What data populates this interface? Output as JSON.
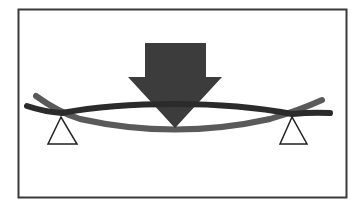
{
  "diagram": {
    "colors": {
      "background": "#ffffff",
      "frame": "#3a3a3a",
      "arrow": "#3c3c3c",
      "beam_straight": "#2b2b2b",
      "beam_deflected": "#5a5a5a",
      "support_stroke": "#222222",
      "support_fill": "#ffffff"
    },
    "elements": {
      "frame": "Border frame",
      "load_arrow": "Downward load arrow",
      "beam_straight": "Unloaded beam",
      "beam_deflected": "Deflected beam",
      "support_left": "Left support (triangle)",
      "support_right": "Right support (triangle)"
    }
  }
}
